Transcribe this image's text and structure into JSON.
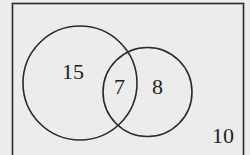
{
  "diagram": {
    "type": "venn",
    "colors": {
      "background": "#ececec",
      "stroke": "#2a2a2a",
      "text": "#1e1e1e"
    },
    "universe": {
      "label_outside": "10"
    },
    "regions": {
      "only_a": "15",
      "a_and_b": "7",
      "only_b": "8",
      "neither": "10"
    },
    "sets": [
      {
        "name": "A",
        "value_only": 15
      },
      {
        "name": "B",
        "value_only": 8
      }
    ]
  }
}
